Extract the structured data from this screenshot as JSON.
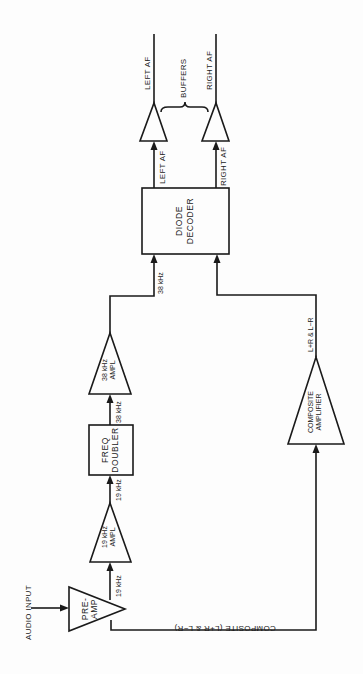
{
  "diagram": {
    "type": "block-diagram",
    "orientation": "rotated 90deg counter-clockwise",
    "colors": {
      "line": "#1a1a1a",
      "background": "#fdfdfd"
    },
    "input": {
      "label": "AUDIO INPUT"
    },
    "blocks": {
      "preamp": {
        "line1": "PRE-",
        "line2": "AMP",
        "shape": "triangle"
      },
      "amp19": {
        "line1": "19 kHz",
        "line2": "AMPL",
        "shape": "triangle"
      },
      "doubler": {
        "line1": "FREQ",
        "line2": "DOUBLER",
        "shape": "box"
      },
      "amp38": {
        "line1": "38 kHz",
        "line2": "AMPL",
        "shape": "triangle"
      },
      "decoder": {
        "line1": "DIODE",
        "line2": "DECODER",
        "shape": "box"
      },
      "composite_amp": {
        "line1": "COMPOSITE",
        "line2": "AMPLIFIER",
        "shape": "triangle"
      },
      "buffer_left": {
        "shape": "triangle"
      },
      "buffer_right": {
        "shape": "triangle"
      }
    },
    "signals": {
      "preamp_out": "19 kHz",
      "amp19_out": "19 kHz",
      "doubler_out": "38 kHz",
      "amp38_out": "38 kHz",
      "composite_line": "COMPOSITE (L+R & L−R)",
      "composite_out": "L+R & L−R",
      "decoder_left": "LEFT AF",
      "decoder_right": "RIGHT AF",
      "out_left": "LEFT AF",
      "out_right": "RIGHT AF"
    },
    "group_label": "BUFFERS"
  }
}
